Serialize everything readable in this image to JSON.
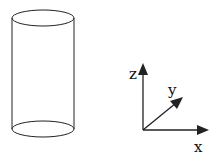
{
  "diagram": {
    "shape": "cylinder",
    "axes": {
      "z_label": "z",
      "y_label": "y",
      "x_label": "x"
    },
    "stroke_color": "#222222",
    "background": "#ffffff"
  }
}
